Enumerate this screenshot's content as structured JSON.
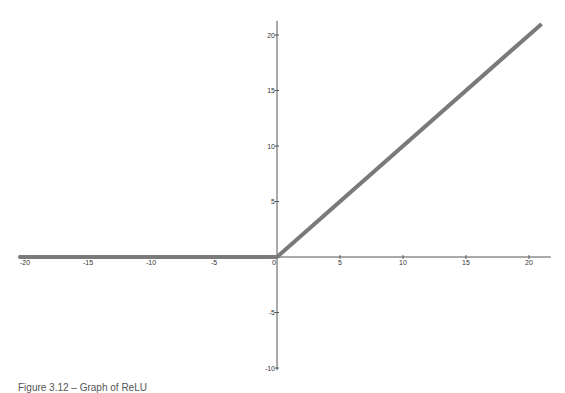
{
  "chart_data": {
    "type": "line",
    "title": "",
    "xlabel": "",
    "ylabel": "",
    "xlim": [
      -20.5,
      21.5
    ],
    "ylim": [
      -10.2,
      21
    ],
    "grid": false,
    "legend": null,
    "x_ticks": [
      -20,
      -15,
      -10,
      -5,
      0,
      5,
      10,
      15,
      20
    ],
    "y_ticks": [
      -10,
      -5,
      5,
      10,
      15,
      20
    ],
    "series": [
      {
        "name": "ReLU",
        "color": "#7a7a7a",
        "points": [
          [
            -20.5,
            0
          ],
          [
            0,
            0
          ],
          [
            21,
            21
          ]
        ]
      }
    ]
  },
  "caption": "Figure 3.12 – Graph of ReLU",
  "colors": {
    "axis": "#555555",
    "line": "#7a7a7a",
    "background": "#ffffff"
  }
}
